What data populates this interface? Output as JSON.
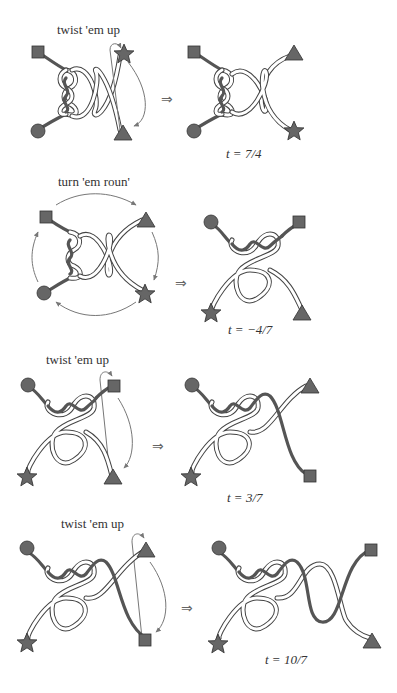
{
  "figure": {
    "panels": [
      {
        "id": 1,
        "operation": "twist 'em up",
        "result_label": "t = 7/4",
        "implies": "⇒"
      },
      {
        "id": 2,
        "operation": "turn 'em roun'",
        "result_label": "t = −4/7",
        "implies": "⇒"
      },
      {
        "id": 3,
        "operation": "twist 'em up",
        "result_label": "t = 3/7",
        "implies": "⇒"
      },
      {
        "id": 4,
        "operation": "twist 'em up",
        "result_label": "t = 10/7",
        "implies": "⇒"
      }
    ],
    "endpoint_markers": [
      "square",
      "circle",
      "triangle",
      "star"
    ],
    "colors": {
      "marker_fill": "#666666",
      "ribbon_outline": "#444444",
      "arrow": "#777777",
      "background": "#ffffff"
    }
  }
}
